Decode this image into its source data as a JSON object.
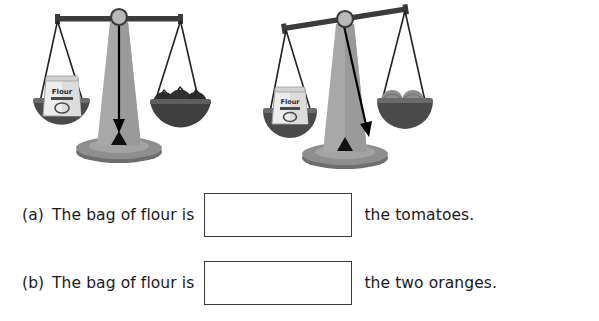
{
  "page": {
    "type": "math-worksheet",
    "topic": "comparing-mass-with-balance-scales",
    "background_color": "#ffffff",
    "text_color": "#1a1a1a"
  },
  "illustration": {
    "name": "two-balance-scales",
    "scales": [
      {
        "id": "scale-1",
        "state": "balanced",
        "beam_tilt_degrees": 0,
        "left_pan": {
          "item": "bag-of-flour",
          "label": "Flour",
          "count": 1
        },
        "right_pan": {
          "item": "tomatoes",
          "count": 3
        }
      },
      {
        "id": "scale-2",
        "state": "tilted-left-heavier",
        "beam_tilt_degrees": -9,
        "left_pan": {
          "item": "bag-of-flour",
          "label": "Flour",
          "count": 1
        },
        "right_pan": {
          "item": "oranges",
          "count": 2
        }
      }
    ],
    "colors": {
      "beam": "#3b3b3b",
      "pivot_fill": "#b4b4b4",
      "pivot_stroke": "#3b3b3b",
      "stand": "#a3a3a3",
      "stand_shadow": "#8a8a8a",
      "base": "#7d7d7d",
      "base_top": "#969696",
      "pan": "#4a4a4a",
      "pan_rim": "#6b6b6b",
      "string": "#222222",
      "pointer": "#000000",
      "flour_bag": "#e8e8e8",
      "flour_bag_shade": "#c6c6c6",
      "tomato": "#2e2e2e",
      "orange": "#8d8d8d",
      "orange_shade": "#6f6f6f"
    }
  },
  "questions": [
    {
      "id": "a",
      "label": "(a)",
      "text_before": "The bag of flour is",
      "answer_value": "",
      "answer_placeholder": "",
      "text_after": "the tomatoes."
    },
    {
      "id": "b",
      "label": "(b)",
      "text_before": "The bag of flour is",
      "answer_value": "",
      "answer_placeholder": "",
      "text_after": "the two oranges."
    }
  ]
}
